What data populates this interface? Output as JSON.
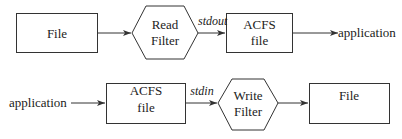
{
  "diagram": {
    "top_row": {
      "source": "File",
      "filter_line1": "Read",
      "filter_line2": "Filter",
      "stream": "stdout",
      "acfs_line1": "ACFS",
      "acfs_line2": "file",
      "target": "application"
    },
    "bottom_row": {
      "source": "application",
      "acfs_line1": "ACFS",
      "acfs_line2": "file",
      "stream": "stdin",
      "filter_line1": "Write",
      "filter_line2": "Filter",
      "target": "File"
    }
  }
}
